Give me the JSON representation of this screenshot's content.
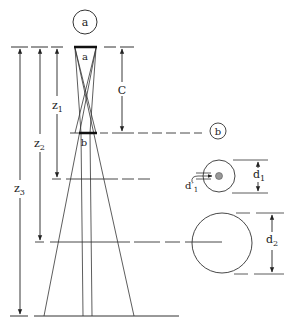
{
  "diagram": {
    "callouts": {
      "a": "a",
      "b": "b"
    },
    "objects": {
      "a_label": "a",
      "b_label": "b"
    },
    "dimensions": {
      "c": "C",
      "z1": "z",
      "z1_sub": "1",
      "z2": "z",
      "z2_sub": "2",
      "z3": "z",
      "z3_sub": "3",
      "d1": "d",
      "d1_sub": "1",
      "d1_prime": "d′",
      "d1_prime_sub": "1",
      "d2": "d",
      "d2_sub": "2"
    },
    "colors": {
      "line": "#333333",
      "background": "#ffffff",
      "spot": "#999999"
    }
  }
}
